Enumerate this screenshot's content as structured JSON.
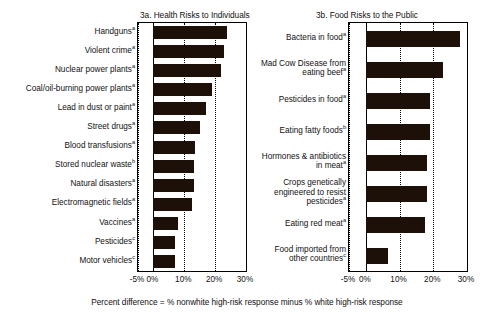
{
  "caption": "Percent difference = % nonwhite high-risk response minus % white high-risk response",
  "axis": {
    "ticks": [
      "-5%",
      "0%",
      "10%",
      "20%",
      "30%"
    ],
    "tick_values": [
      -5,
      0,
      10,
      20,
      30
    ],
    "xmin": -5,
    "xmax": 30
  },
  "panel_a": {
    "title": "3a. Health Risks to Individuals"
  },
  "panel_b": {
    "title": "3b. Food Risks to the Public"
  },
  "chart_data": [
    {
      "type": "bar",
      "orientation": "horizontal",
      "title": "3a. Health Risks to Individuals",
      "xlabel": "Percent difference = % nonwhite high-risk response minus % white high-risk response",
      "ylabel": "",
      "xlim": [
        -5,
        30
      ],
      "xticks": [
        -5,
        0,
        10,
        20,
        30
      ],
      "xticklabels": [
        "-5%",
        "0%",
        "10%",
        "20%",
        "30%"
      ],
      "grid": "vertical-dotted",
      "legend": "none",
      "categories": [
        "Handguns",
        "Violent crime",
        "Nuclear power plants",
        "Coal/oil-burning power plants",
        "Lead in dust or paint",
        "Street drugs",
        "Blood transfusions",
        "Stored nuclear waste",
        "Natural disasters",
        "Electromagnetic fields",
        "Vaccines",
        "Pesticides",
        "Motor vehicles"
      ],
      "category_marks": [
        "a",
        "a",
        "a",
        "a",
        "a",
        "a",
        "a",
        "b",
        "a",
        "a",
        "a",
        "c",
        "c"
      ],
      "values": [
        24,
        23,
        22,
        19,
        17,
        15,
        13.5,
        13,
        13,
        12.5,
        8,
        7,
        7
      ]
    },
    {
      "type": "bar",
      "orientation": "horizontal",
      "title": "3b. Food Risks to the Public",
      "xlabel": "Percent difference = % nonwhite high-risk response minus % white high-risk response",
      "ylabel": "",
      "xlim": [
        -5,
        30
      ],
      "xticks": [
        -5,
        0,
        10,
        20,
        30
      ],
      "xticklabels": [
        "-5%",
        "0%",
        "10%",
        "20%",
        "30%"
      ],
      "grid": "vertical-dotted",
      "legend": "none",
      "categories": [
        "Bacteria in food",
        "Mad Cow Disease from\neating beef",
        "Pesticides in food",
        "Eating fatty foods",
        "Hormones & antibiotics\nin meat",
        "Crops genetically\nengineered to resist\npesticides",
        "Eating red meat",
        "Food imported from\nother countries"
      ],
      "category_marks": [
        "a",
        "a",
        "a",
        "b",
        "a",
        "a",
        "a",
        "c"
      ],
      "values": [
        28,
        23,
        19,
        19,
        18,
        18,
        17.5,
        6.5
      ]
    }
  ]
}
